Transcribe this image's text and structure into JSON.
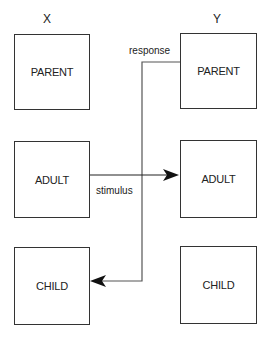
{
  "columns": {
    "x": "X",
    "y": "Y"
  },
  "left_boxes": [
    {
      "label": "PARENT"
    },
    {
      "label": "ADULT"
    },
    {
      "label": "CHILD"
    }
  ],
  "right_boxes": [
    {
      "label": "PARENT"
    },
    {
      "label": "ADULT"
    },
    {
      "label": "CHILD"
    }
  ],
  "transactions": {
    "stimulus_label": "stimulus",
    "response_label": "response"
  }
}
